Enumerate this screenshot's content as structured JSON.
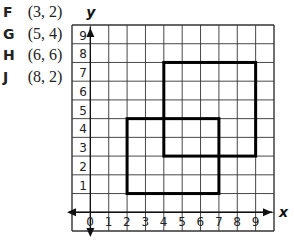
{
  "points": [
    {
      "letter": "F",
      "coord": "(3, 2)"
    },
    {
      "letter": "G",
      "coord": "(5, 4)"
    },
    {
      "letter": "H",
      "coord": "(6, 6)"
    },
    {
      "letter": "J",
      "coord": "(8, 2)"
    }
  ],
  "graph": {
    "x_axis_label": "x",
    "y_axis_label": "y",
    "x_ticks": [
      "0",
      "1",
      "2",
      "3",
      "4",
      "5",
      "6",
      "7",
      "8",
      "9"
    ],
    "y_ticks": [
      "1",
      "2",
      "3",
      "4",
      "5",
      "6",
      "7",
      "8",
      "9"
    ],
    "grid_range": {
      "x": [
        -1,
        10
      ],
      "y": [
        -1,
        10
      ]
    },
    "rectangles": [
      {
        "name": "lower-left-rectangle",
        "x1": 2,
        "y1": 1,
        "x2": 7,
        "y2": 5
      },
      {
        "name": "upper-right-rectangle",
        "x1": 4,
        "y1": 3,
        "x2": 9,
        "y2": 8
      }
    ],
    "colors": {
      "grid": "#333333",
      "rect": "#000000"
    }
  }
}
